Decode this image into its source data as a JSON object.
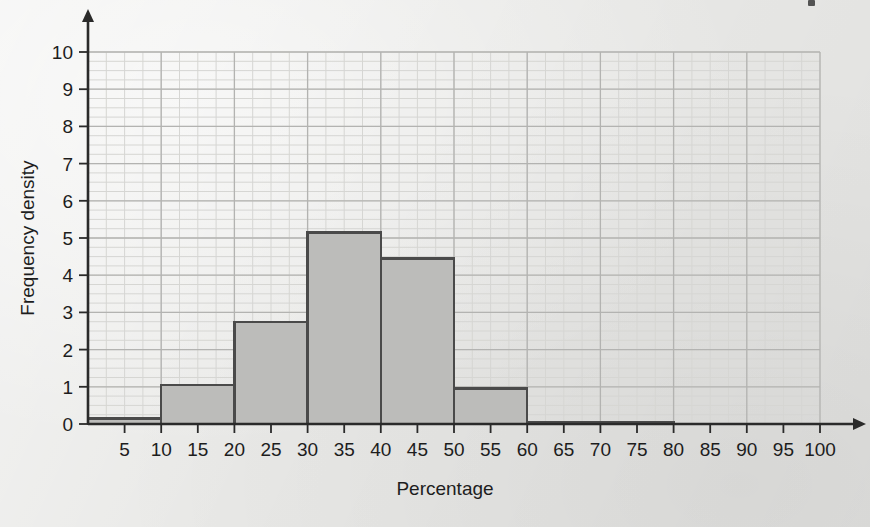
{
  "chart_data": {
    "type": "bar",
    "title": "",
    "subtitle": "",
    "xlabel": "Percentage",
    "ylabel": "Frequency density",
    "xlim": [
      0,
      100
    ],
    "ylim": [
      0,
      10
    ],
    "grid": true,
    "legend": false,
    "legend_position": "none",
    "x_major_step": 10,
    "x_minor_step": 2.5,
    "y_major_step": 1,
    "y_minor_step": 0.25,
    "x_tick_labels": [
      "5",
      "10",
      "15",
      "20",
      "25",
      "30",
      "35",
      "40",
      "45",
      "50",
      "55",
      "60",
      "65",
      "70",
      "75",
      "80",
      "85",
      "90",
      "95",
      "100"
    ],
    "x_tick_values": [
      5,
      10,
      15,
      20,
      25,
      30,
      35,
      40,
      45,
      50,
      55,
      60,
      65,
      70,
      75,
      80,
      85,
      90,
      95,
      100
    ],
    "y_tick_labels": [
      "0",
      "1",
      "2",
      "3",
      "4",
      "5",
      "6",
      "7",
      "8",
      "9",
      "10"
    ],
    "y_tick_values": [
      0,
      1,
      2,
      3,
      4,
      5,
      6,
      7,
      8,
      9,
      10
    ],
    "bins": [
      {
        "label": "0-10",
        "x0": 0,
        "x1": 10,
        "value": 0.15
      },
      {
        "label": "10-20",
        "x0": 10,
        "x1": 20,
        "value": 1.05
      },
      {
        "label": "20-30",
        "x0": 20,
        "x1": 30,
        "value": 2.75
      },
      {
        "label": "30-40",
        "x0": 30,
        "x1": 40,
        "value": 5.15
      },
      {
        "label": "40-50",
        "x0": 40,
        "x1": 50,
        "value": 4.45
      },
      {
        "label": "50-60",
        "x0": 50,
        "x1": 60,
        "value": 0.95
      },
      {
        "label": "60-80",
        "x0": 60,
        "x1": 80,
        "value": 0.05
      }
    ],
    "categories": [
      "0-10",
      "10-20",
      "20-30",
      "30-40",
      "40-50",
      "50-60",
      "60-80"
    ],
    "values": [
      0.15,
      1.05,
      2.75,
      5.15,
      4.45,
      0.95,
      0.05
    ],
    "colors": {
      "background": "#e9e9e7",
      "bar_fill": "#bcbcba",
      "bar_stroke": "#4a4a4a",
      "axis": "#2a2a2a",
      "grid_major": "#b3b3b1",
      "grid_minor": "#d6d6d3",
      "text": "#1d1d1d"
    }
  }
}
